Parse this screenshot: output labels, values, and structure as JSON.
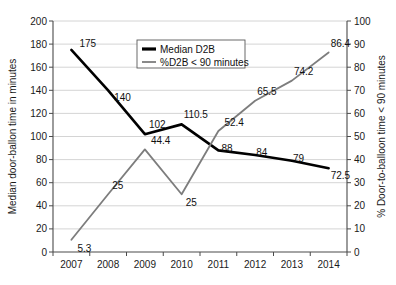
{
  "chart_data": {
    "type": "line",
    "title": "",
    "subtitle": "",
    "xlabel": "",
    "ylabel": "Median door-ballon time in minutes",
    "y2label": "% Door-to-balloon time < 90 minutes",
    "categories": [
      "2007",
      "2008",
      "2009",
      "2010",
      "2011",
      "2012",
      "2013",
      "2014"
    ],
    "ylim": [
      0,
      200
    ],
    "y2lim": [
      0,
      100
    ],
    "yticks": [
      "0",
      "20",
      "40",
      "60",
      "80",
      "100",
      "120",
      "140",
      "160",
      "180",
      "200"
    ],
    "y2ticks": [
      "0",
      "10",
      "20",
      "30",
      "40",
      "50",
      "60",
      "70",
      "80",
      "90",
      "100"
    ],
    "grid": "horizontal",
    "legend_position": "top-center",
    "series": [
      {
        "name": "Median D2B",
        "axis": "left",
        "color": "#000000",
        "width": 2.6,
        "values": [
          175,
          140,
          102,
          110.5,
          88,
          84,
          79,
          72.5
        ],
        "labels": [
          "175",
          "140",
          "102",
          "110.5",
          "88",
          "84",
          "79",
          "72.5"
        ]
      },
      {
        "name": "%D2B < 90 minutes",
        "axis": "right",
        "color": "#7d7d7d",
        "width": 1.8,
        "values": [
          5.3,
          25,
          44.4,
          25,
          52.4,
          65.5,
          74.2,
          86.4
        ],
        "labels": [
          "5.3",
          "25",
          "44.4",
          "25",
          "52.4",
          "65.5",
          "74.2",
          "86.4"
        ]
      }
    ],
    "legend": [
      {
        "label": "Median D2B",
        "color": "#000000",
        "width": 3.2
      },
      {
        "label": "%D2B < 90 minutes",
        "color": "#8a8a8a",
        "width": 2.0
      }
    ]
  }
}
